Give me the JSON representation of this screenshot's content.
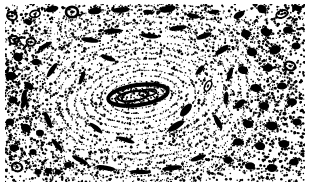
{
  "figure": {
    "kind": "histological-micrograph",
    "rendering": "high-contrast bitonal lithographic halftone",
    "alt_text": "Black and white high-contrast micrograph of a transverse section of compact bone showing a large central Haversian system with concentric lamellae surrounding an elongated oval Haversian canal, dark elongated osteocyte lacunae arranged along the lamellae, and dense interstitial bone with numerous dark lacunae at the left and right margins.",
    "caption": "",
    "width_px": 309,
    "height_px": 189
  },
  "palette": {
    "ink": "#000000",
    "paper": "#ffffff",
    "mid_ink": "#1a1a1a",
    "stipple_ink": "#111111"
  },
  "frame": {
    "margin_left_px": 5,
    "margin_right_px": 4,
    "margin_top_px": 4,
    "margin_bottom_px": 7,
    "content_x": 5,
    "content_y": 4,
    "content_width": 300,
    "content_height": 178
  },
  "structures": {
    "haversian_canal": {
      "label": "central Haversian canal",
      "cx": 138,
      "cy": 95,
      "rx": 30,
      "ry": 10,
      "rotation_deg": -8,
      "wall_thickness": 4
    },
    "osteon_center": {
      "cx": 140,
      "cy": 97
    },
    "lamellae": {
      "label": "concentric lamellae",
      "count": 16,
      "rx_min": 18,
      "rx_max": 150,
      "ry_min": 7,
      "ry_max": 92,
      "rotation_deg": -6,
      "tone": "fine stipple arcs"
    },
    "interstitial_left": {
      "label": "interstitial bone, left margin",
      "x": 5,
      "y": 4,
      "width": 62,
      "height": 178,
      "density": "high"
    },
    "interstitial_right": {
      "label": "interstitial bone, right margin",
      "x": 232,
      "y": 4,
      "width": 73,
      "height": 178,
      "density": "high"
    },
    "interstitial_top": {
      "label": "interstitial bone, upper band",
      "x": 5,
      "y": 4,
      "width": 300,
      "height": 26,
      "density": "medium-high"
    },
    "interstitial_bottom": {
      "label": "interstitial bone, lower band",
      "x": 5,
      "y": 158,
      "width": 300,
      "height": 24,
      "density": "medium"
    }
  },
  "lacunae": {
    "label": "osteocyte lacunae",
    "note": "dark elongated and round bodies; x, y are centers in px, rx/ry radii, rot degrees, ring=true draws an unfilled halo",
    "items": [
      {
        "x": 12,
        "y": 16,
        "rx": 5.0,
        "ry": 4.0,
        "rot": 20,
        "ring": true
      },
      {
        "x": 28,
        "y": 22,
        "rx": 4.0,
        "ry": 2.8,
        "rot": 35,
        "ring": false
      },
      {
        "x": 35,
        "y": 14,
        "rx": 5.2,
        "ry": 3.4,
        "rot": 165,
        "ring": true
      },
      {
        "x": 52,
        "y": 9,
        "rx": 6.5,
        "ry": 3.0,
        "rot": 170,
        "ring": false
      },
      {
        "x": 72,
        "y": 12,
        "rx": 6.0,
        "ry": 5.2,
        "rot": 0,
        "ring": true
      },
      {
        "x": 95,
        "y": 11,
        "rx": 7.0,
        "ry": 3.4,
        "rot": 172,
        "ring": false
      },
      {
        "x": 121,
        "y": 10,
        "rx": 9.0,
        "ry": 2.8,
        "rot": 176,
        "ring": false
      },
      {
        "x": 148,
        "y": 12,
        "rx": 5.0,
        "ry": 2.2,
        "rot": 8,
        "ring": false
      },
      {
        "x": 168,
        "y": 9,
        "rx": 8.0,
        "ry": 3.4,
        "rot": 168,
        "ring": false
      },
      {
        "x": 193,
        "y": 16,
        "rx": 6.5,
        "ry": 2.4,
        "rot": 10,
        "ring": false
      },
      {
        "x": 214,
        "y": 12,
        "rx": 5.5,
        "ry": 2.2,
        "rot": 172,
        "ring": false
      },
      {
        "x": 239,
        "y": 15,
        "rx": 6.0,
        "ry": 3.2,
        "rot": 150,
        "ring": false
      },
      {
        "x": 262,
        "y": 9,
        "rx": 5.0,
        "ry": 4.0,
        "rot": 30,
        "ring": false
      },
      {
        "x": 282,
        "y": 14,
        "rx": 6.0,
        "ry": 3.6,
        "rot": 160,
        "ring": true
      },
      {
        "x": 297,
        "y": 8,
        "rx": 5.0,
        "ry": 3.0,
        "rot": 20,
        "ring": false
      },
      {
        "x": 14,
        "y": 40,
        "rx": 4.6,
        "ry": 4.0,
        "rot": 0,
        "ring": true
      },
      {
        "x": 31,
        "y": 42,
        "rx": 4.4,
        "ry": 3.8,
        "rot": 0,
        "ring": true
      },
      {
        "x": 18,
        "y": 57,
        "rx": 5.0,
        "ry": 4.2,
        "rot": 25,
        "ring": false
      },
      {
        "x": 36,
        "y": 62,
        "rx": 4.2,
        "ry": 3.2,
        "rot": 0,
        "ring": false
      },
      {
        "x": 11,
        "y": 76,
        "rx": 5.4,
        "ry": 4.2,
        "rot": 15,
        "ring": false
      },
      {
        "x": 29,
        "y": 86,
        "rx": 5.0,
        "ry": 3.4,
        "rot": 40,
        "ring": false
      },
      {
        "x": 13,
        "y": 100,
        "rx": 4.6,
        "ry": 3.6,
        "rot": 0,
        "ring": false
      },
      {
        "x": 24,
        "y": 103,
        "rx": 6.0,
        "ry": 2.6,
        "rot": 115,
        "ring": false
      },
      {
        "x": 10,
        "y": 122,
        "rx": 4.2,
        "ry": 3.4,
        "rot": 0,
        "ring": false
      },
      {
        "x": 26,
        "y": 128,
        "rx": 5.2,
        "ry": 4.0,
        "rot": 20,
        "ring": false
      },
      {
        "x": 40,
        "y": 133,
        "rx": 4.0,
        "ry": 3.2,
        "rot": 0,
        "ring": false
      },
      {
        "x": 14,
        "y": 148,
        "rx": 4.4,
        "ry": 3.4,
        "rot": 0,
        "ring": false
      },
      {
        "x": 33,
        "y": 152,
        "rx": 3.6,
        "ry": 3.0,
        "rot": 0,
        "ring": false
      },
      {
        "x": 17,
        "y": 167,
        "rx": 5.2,
        "ry": 4.2,
        "rot": 15,
        "ring": true
      },
      {
        "x": 38,
        "y": 172,
        "rx": 3.4,
        "ry": 3.0,
        "rot": 0,
        "ring": false
      },
      {
        "x": 48,
        "y": 171,
        "rx": 3.4,
        "ry": 3.0,
        "rot": 0,
        "ring": false
      },
      {
        "x": 58,
        "y": 172,
        "rx": 3.2,
        "ry": 2.8,
        "rot": 0,
        "ring": false
      },
      {
        "x": 68,
        "y": 165,
        "rx": 4.0,
        "ry": 3.0,
        "rot": 0,
        "ring": false
      },
      {
        "x": 24,
        "y": 96,
        "rx": 7.0,
        "ry": 2.4,
        "rot": 105,
        "ring": false
      },
      {
        "x": 45,
        "y": 46,
        "rx": 8.0,
        "ry": 2.2,
        "rot": 150,
        "ring": false
      },
      {
        "x": 52,
        "y": 70,
        "rx": 8.5,
        "ry": 2.4,
        "rot": 125,
        "ring": false
      },
      {
        "x": 48,
        "y": 120,
        "rx": 9.0,
        "ry": 2.6,
        "rot": 68,
        "ring": false
      },
      {
        "x": 57,
        "y": 145,
        "rx": 8.0,
        "ry": 2.4,
        "rot": 50,
        "ring": false
      },
      {
        "x": 80,
        "y": 160,
        "rx": 9.0,
        "ry": 2.4,
        "rot": 28,
        "ring": false
      },
      {
        "x": 106,
        "y": 168,
        "rx": 10.0,
        "ry": 2.4,
        "rot": 10,
        "ring": false
      },
      {
        "x": 140,
        "y": 172,
        "rx": 11.0,
        "ry": 2.2,
        "rot": 2,
        "ring": false
      },
      {
        "x": 172,
        "y": 168,
        "rx": 10.0,
        "ry": 2.4,
        "rot": 172,
        "ring": false
      },
      {
        "x": 198,
        "y": 158,
        "rx": 8.0,
        "ry": 2.4,
        "rot": 160,
        "ring": false
      },
      {
        "x": 90,
        "y": 40,
        "rx": 9.0,
        "ry": 2.6,
        "rot": 8,
        "ring": false
      },
      {
        "x": 113,
        "y": 31,
        "rx": 9.5,
        "ry": 2.4,
        "rot": 178,
        "ring": false
      },
      {
        "x": 150,
        "y": 36,
        "rx": 9.0,
        "ry": 2.4,
        "rot": 6,
        "ring": false
      },
      {
        "x": 178,
        "y": 28,
        "rx": 9.0,
        "ry": 2.6,
        "rot": 172,
        "ring": false
      },
      {
        "x": 204,
        "y": 36,
        "rx": 8.0,
        "ry": 2.6,
        "rot": 160,
        "ring": false
      },
      {
        "x": 222,
        "y": 50,
        "rx": 8.0,
        "ry": 2.8,
        "rot": 145,
        "ring": false
      },
      {
        "x": 230,
        "y": 74,
        "rx": 7.0,
        "ry": 2.4,
        "rot": 108,
        "ring": false
      },
      {
        "x": 226,
        "y": 98,
        "rx": 6.5,
        "ry": 2.4,
        "rot": 95,
        "ring": false
      },
      {
        "x": 218,
        "y": 122,
        "rx": 8.0,
        "ry": 2.6,
        "rot": 62,
        "ring": false
      },
      {
        "x": 108,
        "y": 58,
        "rx": 8.0,
        "ry": 2.4,
        "rot": 20,
        "ring": false
      },
      {
        "x": 82,
        "y": 78,
        "rx": 7.0,
        "ry": 2.2,
        "rot": 112,
        "ring": false
      },
      {
        "x": 96,
        "y": 128,
        "rx": 8.0,
        "ry": 2.4,
        "rot": 38,
        "ring": false
      },
      {
        "x": 126,
        "y": 140,
        "rx": 9.0,
        "ry": 2.2,
        "rot": 18,
        "ring": false
      },
      {
        "x": 176,
        "y": 126,
        "rx": 9.5,
        "ry": 3.2,
        "rot": 148,
        "ring": false
      },
      {
        "x": 186,
        "y": 110,
        "rx": 8.0,
        "ry": 3.6,
        "rot": 132,
        "ring": false
      },
      {
        "x": 246,
        "y": 34,
        "rx": 5.0,
        "ry": 4.0,
        "rot": 10,
        "ring": false
      },
      {
        "x": 266,
        "y": 32,
        "rx": 5.6,
        "ry": 4.0,
        "rot": 25,
        "ring": false
      },
      {
        "x": 288,
        "y": 30,
        "rx": 5.0,
        "ry": 3.6,
        "rot": 0,
        "ring": false
      },
      {
        "x": 252,
        "y": 52,
        "rx": 5.4,
        "ry": 4.2,
        "rot": 20,
        "ring": false
      },
      {
        "x": 275,
        "y": 50,
        "rx": 6.0,
        "ry": 4.2,
        "rot": 160,
        "ring": false
      },
      {
        "x": 296,
        "y": 46,
        "rx": 4.6,
        "ry": 3.6,
        "rot": 0,
        "ring": false
      },
      {
        "x": 243,
        "y": 70,
        "rx": 5.2,
        "ry": 4.0,
        "rot": 15,
        "ring": false
      },
      {
        "x": 268,
        "y": 68,
        "rx": 5.0,
        "ry": 3.8,
        "rot": 0,
        "ring": false
      },
      {
        "x": 290,
        "y": 66,
        "rx": 5.4,
        "ry": 4.2,
        "rot": 20,
        "ring": true
      },
      {
        "x": 256,
        "y": 88,
        "rx": 5.6,
        "ry": 4.0,
        "rot": 10,
        "ring": false
      },
      {
        "x": 282,
        "y": 86,
        "rx": 5.0,
        "ry": 3.6,
        "rot": 0,
        "ring": false
      },
      {
        "x": 240,
        "y": 104,
        "rx": 6.4,
        "ry": 3.2,
        "rot": 140,
        "ring": false
      },
      {
        "x": 264,
        "y": 106,
        "rx": 5.2,
        "ry": 4.0,
        "rot": 0,
        "ring": false
      },
      {
        "x": 292,
        "y": 102,
        "rx": 5.0,
        "ry": 3.8,
        "rot": 0,
        "ring": false
      },
      {
        "x": 248,
        "y": 124,
        "rx": 5.4,
        "ry": 4.0,
        "rot": 15,
        "ring": false
      },
      {
        "x": 272,
        "y": 126,
        "rx": 5.8,
        "ry": 4.4,
        "rot": 0,
        "ring": false
      },
      {
        "x": 297,
        "y": 122,
        "rx": 4.6,
        "ry": 3.6,
        "rot": 0,
        "ring": false
      },
      {
        "x": 238,
        "y": 142,
        "rx": 5.0,
        "ry": 3.8,
        "rot": 0,
        "ring": false
      },
      {
        "x": 260,
        "y": 146,
        "rx": 5.2,
        "ry": 4.0,
        "rot": 10,
        "ring": false
      },
      {
        "x": 284,
        "y": 144,
        "rx": 5.4,
        "ry": 4.0,
        "rot": 0,
        "ring": false
      },
      {
        "x": 228,
        "y": 160,
        "rx": 4.6,
        "ry": 3.6,
        "rot": 0,
        "ring": false
      },
      {
        "x": 250,
        "y": 166,
        "rx": 5.0,
        "ry": 3.8,
        "rot": 0,
        "ring": false
      },
      {
        "x": 272,
        "y": 168,
        "rx": 5.2,
        "ry": 4.0,
        "rot": 0,
        "ring": false
      },
      {
        "x": 294,
        "y": 162,
        "rx": 4.8,
        "ry": 3.6,
        "rot": 0,
        "ring": false
      },
      {
        "x": 208,
        "y": 86,
        "rx": 5.6,
        "ry": 3.0,
        "rot": 118,
        "ring": true
      },
      {
        "x": 200,
        "y": 70,
        "rx": 6.0,
        "ry": 2.4,
        "rot": 130,
        "ring": false
      }
    ]
  },
  "stipple": {
    "label": "halftone stipple grain",
    "seed": 20240613,
    "dense_dots": 5200,
    "sparse_dots": 2600,
    "dot_size_min": 0.5,
    "dot_size_max": 1.5
  }
}
